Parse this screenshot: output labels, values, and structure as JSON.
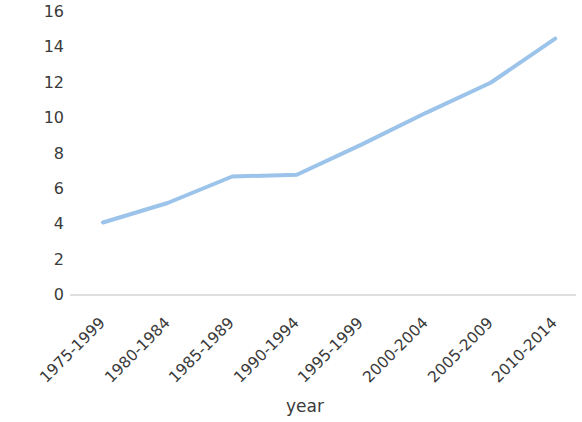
{
  "chart_data": {
    "type": "line",
    "title": "",
    "xlabel": "year",
    "ylabel": "ASR/100,000 women",
    "categories": [
      "1975-1999",
      "1980-1984",
      "1985-1989",
      "1990-1994",
      "1995-1999",
      "2000-2004",
      "2005-2009",
      "2010-2014"
    ],
    "values": [
      4.1,
      5.2,
      6.7,
      6.8,
      8.5,
      10.3,
      12.0,
      14.5
    ],
    "series": [
      {
        "name": "ASR",
        "values": [
          4.1,
          5.2,
          6.7,
          6.8,
          8.5,
          10.3,
          12.0,
          14.5
        ]
      }
    ],
    "ylim": [
      0,
      16
    ],
    "yticks": [
      0,
      2,
      4,
      6,
      8,
      10,
      12,
      14,
      16
    ],
    "ytick_labels": [
      "0",
      "2",
      "4",
      "6",
      "8",
      "10",
      "12",
      "14",
      "16"
    ],
    "grid": false,
    "legend": "none",
    "markers": "none",
    "line_color": "#9CC3E9",
    "axis_line_color": "#D6D6D6",
    "text_color": "#3A3A3A",
    "background_color": "#FFFFFF",
    "line_width": 4
  },
  "axes": {
    "y_title": "ASR/100,000 women",
    "x_title": "year"
  }
}
